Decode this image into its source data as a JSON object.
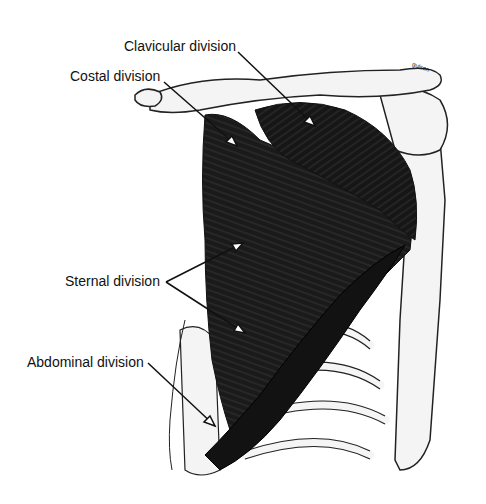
{
  "diagram": {
    "labels": {
      "clavicular": "Clavicular division",
      "costal": "Costal division",
      "sternal": "Sternal division",
      "abdominal": "Abdominal division"
    },
    "signature": "gulsen"
  },
  "colors": {
    "muscle": "#1a1a1a",
    "bone_outline": "#222222",
    "bone_fill": "#f2f2f2",
    "text": "#111111"
  }
}
